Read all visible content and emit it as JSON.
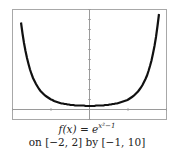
{
  "chart_data": {
    "type": "line",
    "title": "",
    "function": "f(x) = e^(x^2 - 1)",
    "xlim": [
      -2,
      2
    ],
    "ylim": [
      -1,
      10
    ],
    "xlabel": "",
    "ylabel": "",
    "grid": false,
    "x_ticks": [
      -2,
      -1,
      0,
      1,
      2
    ],
    "y_ticks": [
      -1,
      0,
      1,
      2,
      3,
      4,
      5,
      6,
      7,
      8,
      9,
      10
    ],
    "series": [
      {
        "name": "f(x)",
        "x": [
          -1.8,
          -1.6,
          -1.4,
          -1.2,
          -1.0,
          -0.8,
          -0.6,
          -0.4,
          -0.2,
          0,
          0.2,
          0.4,
          0.6,
          0.8,
          1.0,
          1.2,
          1.4,
          1.6,
          1.8
        ],
        "values": [
          9.68,
          5.06,
          2.72,
          1.55,
          1.0,
          0.7,
          0.53,
          0.43,
          0.38,
          0.37,
          0.38,
          0.43,
          0.53,
          0.7,
          1.0,
          1.55,
          2.72,
          5.06,
          9.68
        ]
      }
    ]
  },
  "caption": {
    "function_lhs": "f(x) = e",
    "function_exponent": "x²−1",
    "window": "on [−2, 2] by [−1, 10]"
  },
  "colors": {
    "frame": "#a8a8a8",
    "axis": "#9a9a9a",
    "curve": "#111111"
  }
}
